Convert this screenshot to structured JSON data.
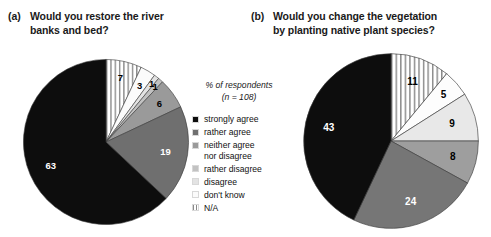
{
  "figure": {
    "background": "#ffffff",
    "panels": [
      {
        "tag": "(a)",
        "title_line1": "Would you restore the river",
        "title_line2": "banks and bed?"
      },
      {
        "tag": "(b)",
        "title_line1": "Would you change the vegetation",
        "title_line2": "by planting native plant species?"
      }
    ]
  },
  "legend": {
    "header_line1": "% of respondents",
    "header_line2": "(n = 108)",
    "items": [
      {
        "label": "strongly agree",
        "color": "#0d0d0d",
        "pattern": "solid"
      },
      {
        "label": "rather agree",
        "color": "#6f6f6f",
        "pattern": "solid"
      },
      {
        "label": "neither agree\nnor disagree",
        "color": "#9a9a9a",
        "pattern": "solid"
      },
      {
        "label": "rather disagree",
        "color": "#c2c2c2",
        "pattern": "solid"
      },
      {
        "label": "disagree",
        "color": "#e3e3e3",
        "pattern": "solid"
      },
      {
        "label": "don't know",
        "color": "#fbfbfb",
        "pattern": "solid"
      },
      {
        "label": "N/A",
        "color": "#ffffff",
        "pattern": "vertical-stripes"
      }
    ]
  },
  "chart_data": [
    {
      "type": "pie",
      "title": "(a) Would you restore the river banks and bed?",
      "unit": "% of respondents",
      "n": 108,
      "start_angle_deg": 0,
      "direction": "clockwise",
      "categories": [
        "strongly agree",
        "rather agree",
        "neither agree nor disagree",
        "rather disagree",
        "disagree",
        "don't know",
        "N/A"
      ],
      "values": [
        63,
        19,
        6,
        1,
        1,
        3,
        7
      ],
      "slice_order_clockwise_from_12": [
        {
          "label": "N/A",
          "value": 7,
          "color": "#ffffff",
          "pattern": "vertical-stripes",
          "label_fill": "dark"
        },
        {
          "label": "don't know",
          "value": 3,
          "color": "#fbfbfb",
          "pattern": "solid",
          "label_fill": "dark"
        },
        {
          "label": "disagree",
          "value": 1,
          "color": "#e3e3e3",
          "pattern": "solid",
          "label_fill": "dark"
        },
        {
          "label": "rather disagree",
          "value": 1,
          "color": "#c2c2c2",
          "pattern": "solid",
          "label_fill": "dark"
        },
        {
          "label": "neither agree nor disagree",
          "value": 6,
          "color": "#9a9a9a",
          "pattern": "solid",
          "label_fill": "dark"
        },
        {
          "label": "rather agree",
          "value": 19,
          "color": "#6f6f6f",
          "pattern": "solid",
          "label_fill": "light"
        },
        {
          "label": "strongly agree",
          "value": 63,
          "color": "#0d0d0d",
          "pattern": "solid",
          "label_fill": "light"
        }
      ]
    },
    {
      "type": "pie",
      "title": "(b) Would you change the vegetation by planting native plant species?",
      "unit": "% of respondents",
      "n": 108,
      "start_angle_deg": 0,
      "direction": "clockwise",
      "categories": [
        "strongly agree",
        "rather agree",
        "neither agree nor disagree",
        "rather disagree",
        "disagree",
        "N/A"
      ],
      "values": [
        43,
        24,
        8,
        9,
        5,
        11
      ],
      "slice_order_clockwise_from_12": [
        {
          "label": "N/A",
          "value": 11,
          "color": "#ffffff",
          "pattern": "vertical-stripes",
          "label_fill": "dark"
        },
        {
          "label": "disagree",
          "value": 5,
          "color": "#fdfdfd",
          "pattern": "solid",
          "label_fill": "dark"
        },
        {
          "label": "rather disagree",
          "value": 9,
          "color": "#e8e8e8",
          "pattern": "solid",
          "label_fill": "dark"
        },
        {
          "label": "neither agree nor disagree",
          "value": 8,
          "color": "#9e9e9e",
          "pattern": "solid",
          "label_fill": "dark"
        },
        {
          "label": "rather agree",
          "value": 24,
          "color": "#767676",
          "pattern": "solid",
          "label_fill": "light"
        },
        {
          "label": "strongly agree",
          "value": 43,
          "color": "#0d0d0d",
          "pattern": "solid",
          "label_fill": "light"
        }
      ]
    }
  ]
}
